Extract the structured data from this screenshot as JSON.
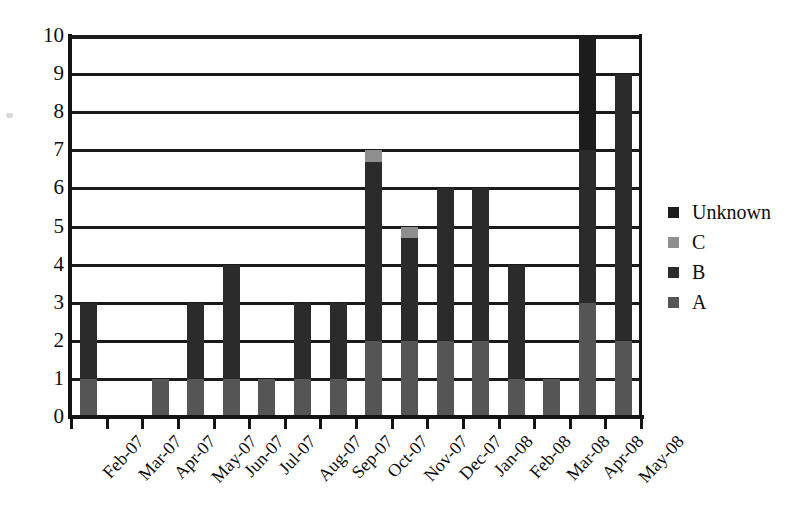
{
  "chart_data": {
    "type": "bar",
    "subtype": "stacked-bar",
    "title": "",
    "xlabel": "",
    "ylabel": "",
    "ylim": [
      0,
      10
    ],
    "ytick_labels": [
      "0",
      "1",
      "2",
      "3",
      "4",
      "5",
      "6",
      "7",
      "8",
      "9",
      "10"
    ],
    "ytick_values": [
      0,
      1,
      2,
      3,
      4,
      5,
      6,
      7,
      8,
      9,
      10
    ],
    "grid": true,
    "grid_axis": "y",
    "legend_position": "right",
    "categories": [
      "Feb-07",
      "Mar-07",
      "Apr-07",
      "May-07",
      "Jun-07",
      "Jul-07",
      "Aug-07",
      "Sep-07",
      "Oct-07",
      "Nov-07",
      "Dec-07",
      "Jan-08",
      "Feb-08",
      "Mar-08",
      "Apr-08",
      "May-08"
    ],
    "series": [
      {
        "name": "A",
        "color": "#555555",
        "values": [
          1,
          0,
          1,
          1,
          1,
          1,
          1,
          1,
          2,
          2,
          2,
          2,
          1,
          1,
          3,
          2
        ]
      },
      {
        "name": "B",
        "color": "#2b2b2b",
        "values": [
          2,
          0,
          0,
          2,
          3,
          0,
          2,
          2,
          4.7,
          2.7,
          4,
          4,
          3,
          0,
          4,
          7
        ]
      },
      {
        "name": "C",
        "color": "#8f8f8f",
        "values": [
          0,
          0,
          0,
          0,
          0,
          0,
          0,
          0,
          0.3,
          0.3,
          0,
          0,
          0,
          0,
          0,
          0
        ]
      },
      {
        "name": "Unknown",
        "color": "#1c1c1c",
        "values": [
          0,
          0,
          0,
          0,
          0,
          0,
          0,
          0,
          0,
          0,
          0,
          0,
          0,
          0,
          3,
          0
        ]
      }
    ],
    "totals": [
      3,
      0,
      1,
      3,
      4,
      1,
      3,
      3,
      7,
      5,
      6,
      6,
      4,
      1,
      10,
      9
    ]
  },
  "legend": {
    "items": [
      {
        "label": "Unknown",
        "color": "#1c1c1c"
      },
      {
        "label": "C",
        "color": "#8f8f8f"
      },
      {
        "label": "B",
        "color": "#2b2b2b"
      },
      {
        "label": "A",
        "color": "#555555"
      }
    ]
  },
  "axis": {
    "y_max": 10,
    "y_min": 0,
    "axis_color": "#141414",
    "grid_color": "#1a1a1a"
  }
}
